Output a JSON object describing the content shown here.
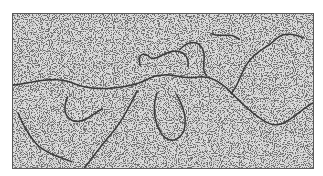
{
  "figure": {
    "colors": {
      "background": "#ffffff",
      "field": "#d9d9d9",
      "speckle": "#2a2a2a",
      "strand": "#3a3a3a",
      "border": "#5a5a5a"
    }
  }
}
